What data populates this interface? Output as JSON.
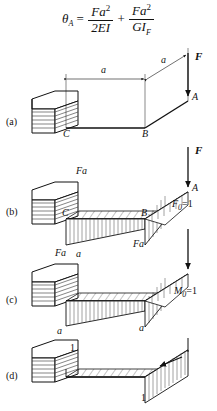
{
  "figure": {
    "equation": {
      "lhs": "θ",
      "lhs_sub": "A",
      "eq": "=",
      "term1_num": "Fa",
      "term1_num_sup": "2",
      "term1_den": "2EI",
      "plus": "+",
      "term2_num": "Fa",
      "term2_num_sup": "2",
      "term2_den": "GI",
      "term2_den_sub": "F"
    },
    "panels": [
      {
        "id": "a",
        "label": "(a)",
        "annotations": {
          "dim_horizontal": "a",
          "dim_diagonal": "a",
          "force": "F",
          "point_a": "A",
          "point_b": "B",
          "point_c": "C"
        }
      },
      {
        "id": "b",
        "label": "(b)",
        "annotations": {
          "moment_top": "Fa",
          "moment_left": "Fa",
          "moment_right": "Fa",
          "force": "F",
          "point_a": "A",
          "point_b": "B",
          "point_c": "C"
        }
      },
      {
        "id": "c",
        "label": "(c)",
        "annotations": {
          "unit_top": "a",
          "unit_left": "a",
          "unit_right": "a",
          "unit_force": "F",
          "unit_force_sub": "0",
          "unit_force_val": "=1"
        }
      },
      {
        "id": "d",
        "label": "(d)",
        "annotations": {
          "unit_top": "1",
          "unit_bottom": "1",
          "unit_moment": "M",
          "unit_moment_sub": "0",
          "unit_moment_val": "=1"
        }
      }
    ],
    "colors": {
      "ink": "#111111",
      "hatch": "#555555",
      "background": "#ffffff"
    }
  }
}
